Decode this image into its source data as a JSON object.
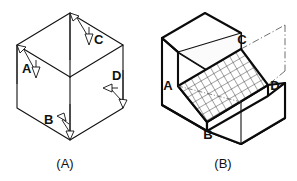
{
  "figure": {
    "background_color": "#ffffff",
    "line_color": "#111111",
    "panels": [
      {
        "id": "panel-a",
        "caption": "(A)",
        "description": "Isometric cube drawn as a hexagon with three visible faces and four direction arrows",
        "shape": "isometric-cube-hexagon",
        "direction_arrows": [
          {
            "label": "A",
            "points": "down",
            "face": "left-top-edge"
          },
          {
            "label": "B",
            "points": "up-left",
            "face": "bottom-front"
          },
          {
            "label": "C",
            "points": "down",
            "face": "top-right-edge"
          },
          {
            "label": "D",
            "points": "left",
            "face": "right-face"
          }
        ]
      },
      {
        "id": "panel-b",
        "caption": "(B)",
        "description": "Isometric block with an inclined hatched surface, corners labelled A, B, C, D",
        "shape": "isometric-block-with-inclined-hatched-face",
        "surface_fill": "cross-hatch-grid",
        "vertex_labels": [
          "A",
          "B",
          "C",
          "D"
        ],
        "phantom_lines": true
      }
    ],
    "labels": {
      "a_dir": "A",
      "b_dir": "B",
      "c_dir": "C",
      "d_dir": "D",
      "a_vertex": "A",
      "b_vertex": "B",
      "c_vertex": "C",
      "d_vertex": "D",
      "caption_a": "(A)",
      "caption_b": "(B)"
    }
  }
}
